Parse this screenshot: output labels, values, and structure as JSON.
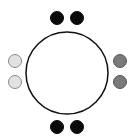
{
  "diagram": {
    "type": "round-table-seating",
    "table": {
      "cx": 67,
      "cy": 73,
      "r": 41,
      "stroke": "#111111",
      "fill": "#ffffff",
      "stroke_width": 1.5
    },
    "seat_radius": 6.5,
    "seats": [
      {
        "side": "top",
        "cx": 57,
        "cy": 18,
        "fill": "#0a0a0a",
        "stroke": "#0a0a0a"
      },
      {
        "side": "top",
        "cx": 77,
        "cy": 18,
        "fill": "#0a0a0a",
        "stroke": "#0a0a0a"
      },
      {
        "side": "left",
        "cx": 15,
        "cy": 61,
        "fill": "#e2e2e2",
        "stroke": "#8a8a8a"
      },
      {
        "side": "left",
        "cx": 15,
        "cy": 82,
        "fill": "#e2e2e2",
        "stroke": "#8a8a8a"
      },
      {
        "side": "right",
        "cx": 120,
        "cy": 61,
        "fill": "#7a7a7a",
        "stroke": "#555555"
      },
      {
        "side": "right",
        "cx": 120,
        "cy": 82,
        "fill": "#7a7a7a",
        "stroke": "#555555"
      },
      {
        "side": "bottom",
        "cx": 57,
        "cy": 127,
        "fill": "#0a0a0a",
        "stroke": "#0a0a0a"
      },
      {
        "side": "bottom",
        "cx": 77,
        "cy": 127,
        "fill": "#0a0a0a",
        "stroke": "#0a0a0a"
      }
    ]
  }
}
